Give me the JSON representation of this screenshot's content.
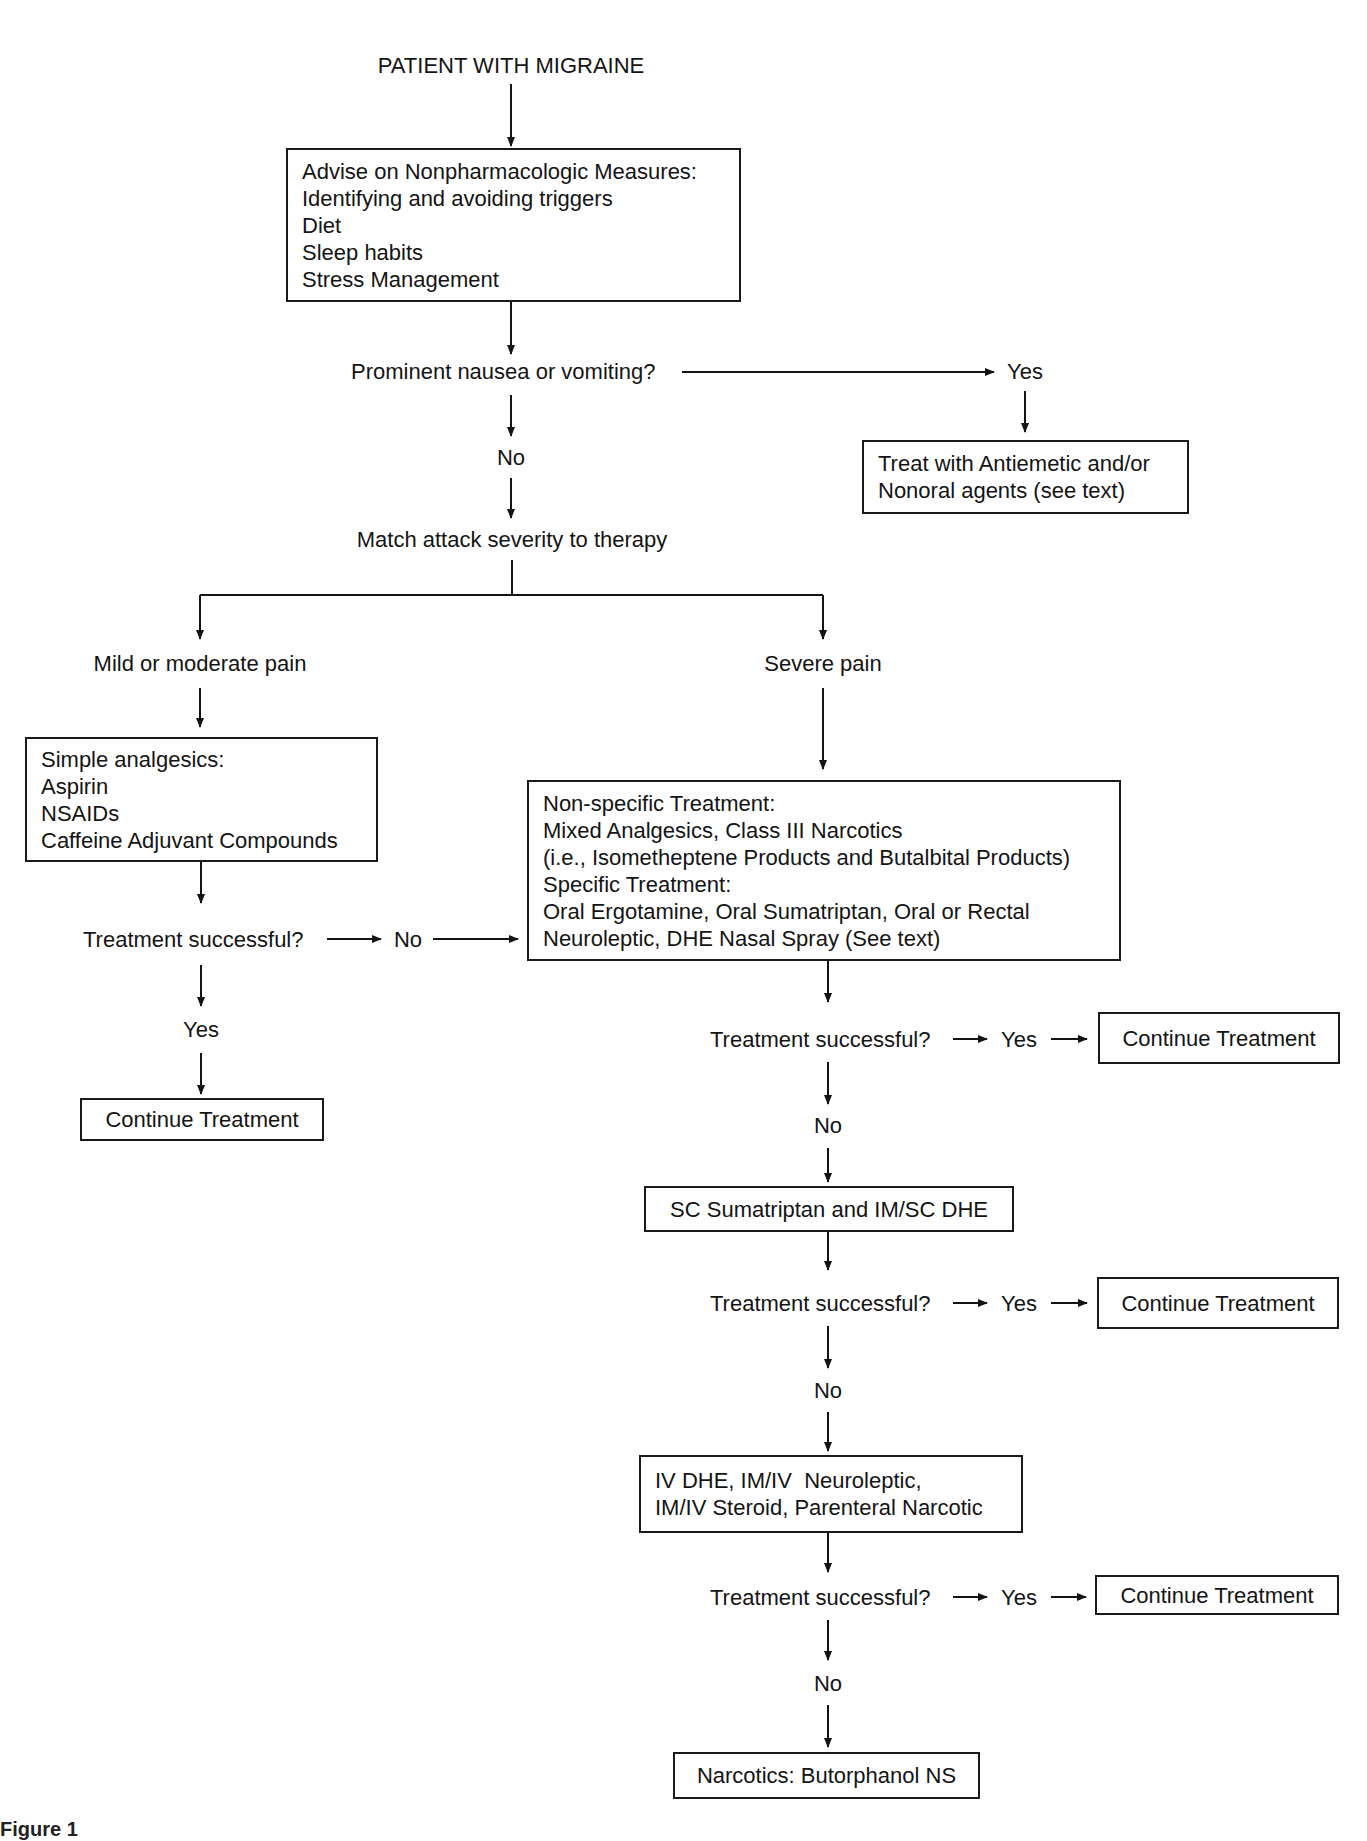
{
  "figure": {
    "caption": "Figure 1"
  },
  "flowchart": {
    "start": "PATIENT WITH MIGRAINE",
    "advise_box": {
      "lines": [
        "Advise on Nonpharmacologic Measures:",
        "Identifying and avoiding triggers",
        "Diet",
        "Sleep habits",
        "Stress Management"
      ]
    },
    "nausea_question": "Prominent nausea or vomiting?",
    "nausea_yes": "Yes",
    "nausea_no": "No",
    "antiemetic_box": {
      "lines": [
        "Treat with Antiemetic and/or",
        "Nonoral agents (see text)"
      ]
    },
    "match_step": "Match attack severity to therapy",
    "mild_branch": {
      "label": "Mild or moderate pain",
      "box": {
        "lines": [
          "Simple analgesics:",
          "Aspirin",
          "NSAIDs",
          "Caffeine Adjuvant Compounds"
        ]
      },
      "question": "Treatment successful?",
      "no_label": "No",
      "yes_label": "Yes",
      "outcome": "Continue Treatment"
    },
    "severe_branch": {
      "label": "Severe pain",
      "box": {
        "lines": [
          "Non-specific Treatment:",
          "Mixed Analgesics, Class III Narcotics",
          "(i.e., Isometheptene Products and Butalbital Products)",
          "Specific Treatment:",
          "Oral Ergotamine, Oral Sumatriptan, Oral or Rectal",
          "Neuroleptic, DHE Nasal Spray (See text)"
        ]
      },
      "steps": [
        {
          "question": "Treatment successful?",
          "yes_label": "Yes",
          "outcome": "Continue Treatment",
          "no_label": "No",
          "next_box": [
            "SC Sumatriptan and IM/SC DHE"
          ]
        },
        {
          "question": "Treatment successful?",
          "yes_label": "Yes",
          "outcome": "Continue Treatment",
          "no_label": "No",
          "next_box": [
            "IV DHE, IM/IV  Neuroleptic,",
            "IM/IV Steroid, Parenteral Narcotic"
          ]
        },
        {
          "question": "Treatment successful?",
          "yes_label": "Yes",
          "outcome": "Continue Treatment",
          "no_label": "No",
          "next_box": [
            "Narcotics: Butorphanol NS"
          ]
        }
      ]
    }
  }
}
